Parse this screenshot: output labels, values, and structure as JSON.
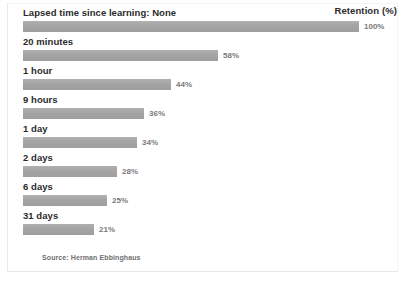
{
  "chart_data": {
    "type": "bar",
    "orientation": "horizontal",
    "title": "Lapsed time since learning: None",
    "legend_title": "Retention (%)",
    "xlabel": "",
    "ylabel": "",
    "xlim": [
      0,
      100
    ],
    "grid": false,
    "legend_position": "top-right",
    "source": "Source: Herman Ebbinghaus",
    "categories": [
      "Lapsed time since learning: None",
      "20 minutes",
      "1 hour",
      "9 hours",
      "1 day",
      "2 days",
      "6 days",
      "31 days"
    ],
    "values": [
      100,
      58,
      44,
      36,
      34,
      28,
      25,
      21
    ],
    "value_labels": [
      "100%",
      "58%",
      "44%",
      "36%",
      "34%",
      "28%",
      "25%",
      "21%"
    ],
    "bar_color": "#a7a7a7",
    "label_color": "#2b2b2b",
    "value_label_color": "#7a7a7a"
  },
  "chart": {
    "legend_title": "Retention (%)",
    "source_note": "Source: Herman Ebbinghaus",
    "rows": [
      {
        "label": "Lapsed time since learning: None",
        "value": 100,
        "value_label": "100%"
      },
      {
        "label": "20 minutes",
        "value": 58,
        "value_label": "58%"
      },
      {
        "label": "1 hour",
        "value": 44,
        "value_label": "44%"
      },
      {
        "label": "9 hours",
        "value": 36,
        "value_label": "36%"
      },
      {
        "label": "1 day",
        "value": 34,
        "value_label": "34%"
      },
      {
        "label": "2 days",
        "value": 28,
        "value_label": "28%"
      },
      {
        "label": "6 days",
        "value": 25,
        "value_label": "25%"
      },
      {
        "label": "31 days",
        "value": 21,
        "value_label": "21%"
      }
    ]
  }
}
